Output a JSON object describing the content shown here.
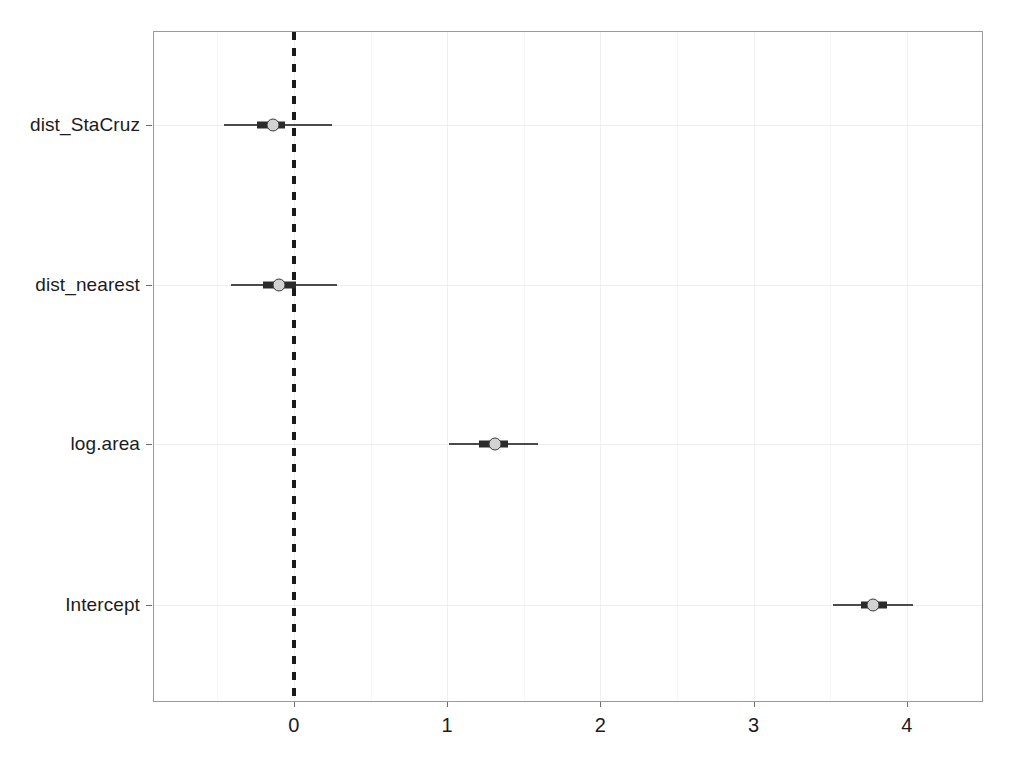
{
  "chart_data": {
    "type": "scatter",
    "subtype": "coefficient-forest-plot",
    "title": "",
    "subtitle": "",
    "xlabel": "",
    "ylabel": "",
    "grid": true,
    "legend": null,
    "xlim": [
      -0.92,
      4.5
    ],
    "x_ticks": [
      0,
      1,
      2,
      3,
      4
    ],
    "x_tick_labels": [
      "0",
      "1",
      "2",
      "3",
      "4"
    ],
    "categories": [
      "dist_StaCruz",
      "dist_nearest",
      "log.area",
      "Intercept"
    ],
    "reference_line": {
      "x": 0,
      "style": "dashed",
      "color": "#1a1a1a"
    },
    "points": [
      {
        "term": "dist_StaCruz",
        "estimate": -0.14,
        "inner_low": -0.24,
        "inner_high": -0.06,
        "outer_low": -0.46,
        "outer_high": 0.25
      },
      {
        "term": "dist_nearest",
        "estimate": -0.1,
        "inner_low": -0.2,
        "inner_high": 0.01,
        "outer_low": -0.41,
        "outer_high": 0.28
      },
      {
        "term": "log.area",
        "estimate": 1.31,
        "inner_low": 1.21,
        "inner_high": 1.4,
        "outer_low": 1.01,
        "outer_high": 1.59
      },
      {
        "term": "Intercept",
        "estimate": 3.78,
        "inner_low": 3.7,
        "inner_high": 3.87,
        "outer_low": 3.52,
        "outer_high": 4.04
      }
    ],
    "colors": {
      "point_fill": "#d2d2d2",
      "point_stroke": "#3a3a3a",
      "inner_interval": "#2b2b2b",
      "outer_interval": "#4a4a4a",
      "reference_line": "#1a1a1a",
      "frame": "#9a9a9a",
      "grid": "#f0f0f0",
      "background": "#ffffff",
      "text": "#1c1c1c"
    }
  },
  "axis": {
    "x_tick_labels": [
      "0",
      "1",
      "2",
      "3",
      "4"
    ],
    "y_tick_labels": [
      "dist_StaCruz",
      "dist_nearest",
      "log.area",
      "Intercept"
    ]
  }
}
